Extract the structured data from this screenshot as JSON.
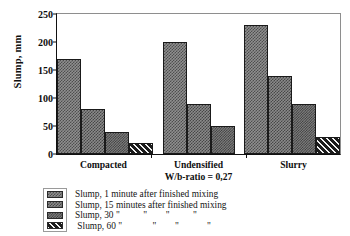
{
  "chart_data": {
    "type": "bar",
    "title": "",
    "xlabel": "W/b-ratio = 0,27",
    "ylabel": "Slump, mm",
    "ylim": [
      0,
      250
    ],
    "yticks": [
      0,
      50,
      100,
      150,
      200,
      250
    ],
    "grid": false,
    "legend_position": "bottom-left",
    "categories": [
      "Compacted",
      "Undensified",
      "Slurry"
    ],
    "category_sublabels": [
      "",
      "W/b-ratio = 0,27",
      ""
    ],
    "series": [
      {
        "name": "Slump, 1 minute after finished mixing",
        "values": [
          170,
          200,
          230
        ]
      },
      {
        "name": "Slump, 15 minutes after finished mixing",
        "values": [
          80,
          90,
          140
        ]
      },
      {
        "name": "Slump, 30 \"        \"        \"        \"",
        "values": [
          40,
          50,
          90
        ]
      },
      {
        "name": "Slump, 60 \"        \"        \"        \"",
        "values": [
          20,
          null,
          30
        ]
      }
    ]
  },
  "axis": {
    "y_title": "Slump, mm",
    "ticks": [
      "250",
      "200",
      "150",
      "100",
      "50",
      "0"
    ]
  },
  "categories": [
    {
      "label": "Compacted",
      "sublabel": ""
    },
    {
      "label": "Undensified",
      "sublabel": "W/b-ratio = 0,27"
    },
    {
      "label": "Slurry",
      "sublabel": ""
    }
  ],
  "legend": {
    "items": [
      {
        "label": "Slump, 1 minute after finished mixing"
      },
      {
        "label": "Slump, 15 minutes after finished mixing"
      },
      {
        "label": "Slump, 30 \"          \"        \"          \""
      },
      {
        "label": " Slump, 60 \"             \"        \"            \""
      }
    ]
  }
}
